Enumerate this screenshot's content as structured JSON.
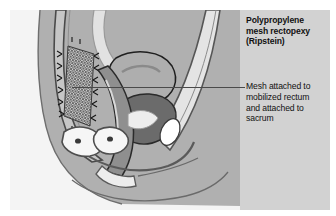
{
  "figure": {
    "kind": "medical-illustration",
    "view": "sagittal pelvic section",
    "title_lines": [
      "Polypropylene",
      "mesh rectopexy",
      "(Ripstein)"
    ],
    "title_text": "Polypropylene mesh rectopexy (Ripstein)",
    "annotation_lines": [
      "Mesh attached to",
      "mobilized rectum",
      "and attached to",
      "sacrum"
    ],
    "annotation_text": "Mesh attached to mobilized rectum and attached to sacrum",
    "leader_line": {
      "orientation": "horizontal",
      "from_x": 72,
      "to_x": 245,
      "y": 87
    }
  },
  "colors": {
    "page_background": "#ffffff",
    "body_field": "#b0b0b0",
    "text_panel": "#d2d2d2",
    "outline_dark": "#3f3f3f",
    "outline_mid": "#707070",
    "tissue_light": "#f2f2f2",
    "tissue_pale": "#dcdcdc",
    "tissue_mid": "#a8a8a8",
    "tissue_dark": "#7d7d7d",
    "tissue_darker": "#666666",
    "mesh_hatch": "#4a4a4a",
    "suture": "#1e1e1e",
    "text": "#111111"
  },
  "structures": [
    {
      "name": "sacrum",
      "shade": "tissue_mid"
    },
    {
      "name": "polypropylene-mesh",
      "shade": "mesh_hatch"
    },
    {
      "name": "sutures",
      "shade": "suture"
    },
    {
      "name": "rectum",
      "shade": "tissue_dark"
    },
    {
      "name": "bladder",
      "shade": "tissue_mid"
    },
    {
      "name": "uterus",
      "shade": "tissue_darker"
    },
    {
      "name": "vagina",
      "shade": "tissue_pale"
    },
    {
      "name": "pubic-bone",
      "shade": "tissue_light"
    },
    {
      "name": "abdominal-wall",
      "shade": "tissue_pale"
    },
    {
      "name": "anal-canal",
      "shade": "tissue_light"
    }
  ]
}
